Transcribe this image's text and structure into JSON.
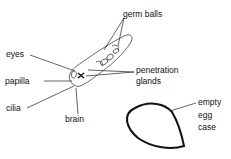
{
  "diagram": {
    "labels": {
      "germ_balls": "germ balls",
      "eyes": "eyes",
      "papilla": "papilla",
      "cilia": "cilia",
      "brain": "brain",
      "penetration_line1": "penetration",
      "penetration_line2": "glands",
      "egg_line1": "empty",
      "egg_line2": "egg",
      "egg_line3": "case"
    },
    "colors": {
      "line": "#222222",
      "label": "#111111",
      "background": "#ffffff"
    }
  }
}
